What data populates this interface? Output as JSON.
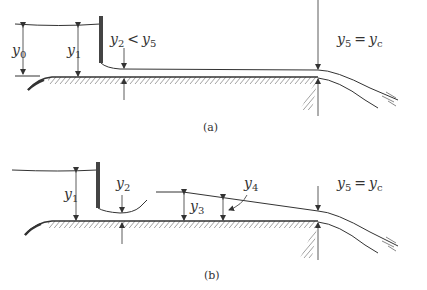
{
  "figure": {
    "panel_a": {
      "caption": "(a)",
      "labels": {
        "y0": {
          "base": "y",
          "sub": "0"
        },
        "y1": {
          "base": "y",
          "sub": "1"
        },
        "y2_lt_y5": {
          "lhs_base": "y",
          "lhs_sub": "2",
          "op": "<",
          "rhs_base": "y",
          "rhs_sub": "5"
        },
        "y5_eq_yc": {
          "lhs_base": "y",
          "lhs_sub": "5",
          "op": "=",
          "rhs_base": "y",
          "rhs_sub": "c"
        }
      }
    },
    "panel_b": {
      "caption": "(b)",
      "labels": {
        "y1": {
          "base": "y",
          "sub": "1"
        },
        "y2": {
          "base": "y",
          "sub": "2"
        },
        "y3": {
          "base": "y",
          "sub": "3"
        },
        "y4": {
          "base": "y",
          "sub": "4"
        },
        "y5_eq_yc": {
          "lhs_base": "y",
          "lhs_sub": "5",
          "op": "=",
          "rhs_base": "y",
          "rhs_sub": "c"
        }
      }
    },
    "colors": {
      "ink": "#333333",
      "background": "#ffffff"
    }
  }
}
